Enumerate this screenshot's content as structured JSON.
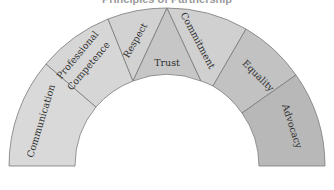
{
  "title": "Principles of Partnership",
  "colors": {
    "light": "#d9d9d9",
    "mid": "#c8c8c8",
    "dark": "#bababa",
    "stroke": "#7a7a7a"
  },
  "segments": [
    {
      "label": "Communication"
    },
    {
      "label": "Professional"
    },
    {
      "label": "Competence"
    },
    {
      "label": "Respect"
    },
    {
      "label": "Trust"
    },
    {
      "label": "Commitment"
    },
    {
      "label": "Equality"
    },
    {
      "label": "Advocacy"
    }
  ]
}
